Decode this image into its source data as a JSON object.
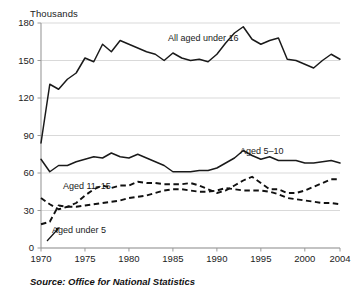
{
  "figure": {
    "units_label": "Thousands",
    "source_note": "Source: Office for National Statistics"
  },
  "chart_data": {
    "type": "line",
    "title": "",
    "subtitle": "",
    "xlabel": "",
    "ylabel": "Thousands",
    "xlim": [
      1970,
      2004
    ],
    "ylim": [
      0,
      180
    ],
    "grid": true,
    "legend_position": "inline-annotations",
    "yticks": [
      0,
      30,
      60,
      90,
      120,
      150,
      180
    ],
    "xticks": [
      1970,
      1975,
      1980,
      1985,
      1990,
      1995,
      2000,
      2004
    ],
    "x": [
      1970,
      1971,
      1972,
      1973,
      1974,
      1975,
      1976,
      1977,
      1978,
      1979,
      1980,
      1981,
      1982,
      1983,
      1984,
      1985,
      1986,
      1987,
      1988,
      1989,
      1990,
      1991,
      1992,
      1993,
      1994,
      1995,
      1996,
      1997,
      1998,
      1999,
      2000,
      2001,
      2002,
      2003,
      2004
    ],
    "series": [
      {
        "name": "All aged under 16",
        "style": "solid",
        "annotation": "All aged under 16",
        "values": [
          84,
          131,
          127,
          135,
          140,
          152,
          149,
          163,
          157,
          166,
          163,
          160,
          157,
          155,
          150,
          156,
          152,
          150,
          151,
          149,
          155,
          164,
          172,
          177,
          167,
          163,
          166,
          168,
          151,
          150,
          147,
          144,
          150,
          155,
          151
        ]
      },
      {
        "name": "Aged 5-10",
        "style": "solid",
        "annotation": "Aged 5–10",
        "values": [
          71,
          61,
          66,
          66,
          69,
          71,
          73,
          72,
          76,
          73,
          72,
          75,
          72,
          69,
          66,
          61,
          61,
          61,
          62,
          62,
          64,
          68,
          72,
          78,
          74,
          71,
          73,
          70,
          70,
          70,
          68,
          68,
          69,
          70,
          68
        ]
      },
      {
        "name": "Aged 11-15",
        "style": "dashed",
        "annotation": "Aged 11–15",
        "values": [
          40,
          35,
          31,
          33,
          36,
          42,
          47,
          50,
          48,
          50,
          50,
          53,
          52,
          52,
          51,
          51,
          51,
          52,
          50,
          47,
          44,
          46,
          50,
          54,
          57,
          52,
          47,
          47,
          44,
          44,
          46,
          49,
          52,
          55,
          55
        ]
      },
      {
        "name": "Aged under 5",
        "style": "dashed",
        "annotation": "Aged under 5",
        "values": [
          19,
          21,
          34,
          33,
          33,
          34,
          35,
          36,
          37,
          38,
          40,
          41,
          42,
          44,
          46,
          47,
          47,
          46,
          45,
          45,
          46,
          48,
          47,
          46,
          46,
          46,
          45,
          43,
          40,
          39,
          38,
          37,
          36,
          36,
          35
        ]
      }
    ]
  },
  "annotations": [
    {
      "label": "All aged under 16",
      "x": 168,
      "y": 41
    },
    {
      "label": "Aged 5–10",
      "x": 240,
      "y": 154
    },
    {
      "label": "Aged 11–15",
      "x": 63,
      "y": 189
    },
    {
      "label": "Aged under 5",
      "x": 52,
      "y": 233
    }
  ]
}
